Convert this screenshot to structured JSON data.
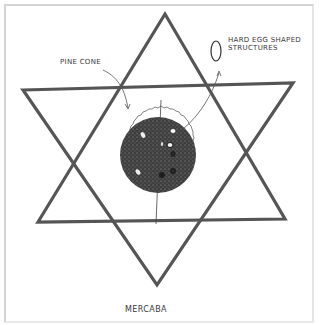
{
  "diagram": {
    "title": "MERCABA",
    "labels": {
      "pinecone": "PINE CONE",
      "egg_structures": "HARD EGG SHAPED STRUCTURES"
    },
    "shapes": {
      "star": "six-pointed star (two overlapping triangles)",
      "core": "stippled dark circle (pine cone)",
      "halo": "wavy outline ring",
      "axis": "vertical line through center",
      "egg_icon": "oval"
    },
    "colors": {
      "line": "#555555",
      "core": "#3c3c3c",
      "background": "#ffffff",
      "frame": "#d4d4d4"
    }
  }
}
